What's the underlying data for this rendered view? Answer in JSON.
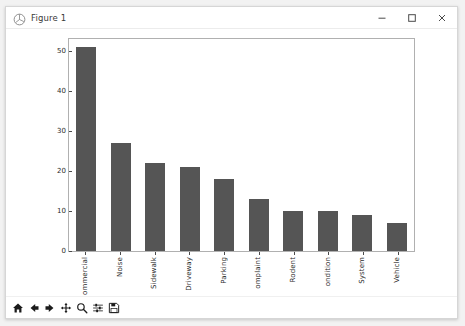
{
  "window": {
    "title": "Figure 1",
    "app_icon": "matplotlib-figure-icon",
    "minimize_label": "–",
    "maximize_label": "□",
    "close_label": "✕"
  },
  "toolbar": {
    "buttons": [
      {
        "name": "home-button",
        "tooltip": "Reset original view"
      },
      {
        "name": "back-button",
        "tooltip": "Back to previous view"
      },
      {
        "name": "forward-button",
        "tooltip": "Forward to next view"
      },
      {
        "name": "pan-button",
        "tooltip": "Pan axes with left mouse, zoom with right"
      },
      {
        "name": "zoom-button",
        "tooltip": "Zoom to rectangle"
      },
      {
        "name": "configure-subplots-button",
        "tooltip": "Configure subplots"
      },
      {
        "name": "save-button",
        "tooltip": "Save the figure"
      }
    ]
  },
  "chart_data": {
    "type": "bar",
    "title": "",
    "xlabel": "",
    "ylabel": "",
    "ylim": [
      0,
      53
    ],
    "yticks": [
      0,
      10,
      20,
      30,
      40,
      50
    ],
    "grid": false,
    "legend": null,
    "bar_color": "#555555",
    "xtick_rotation": 90,
    "categories": [
      "ommercial",
      "Noise",
      "Sidewalk",
      "Driveway",
      "Parking",
      "omplaint",
      "Rodent",
      "ondition",
      "System",
      "Vehicle"
    ],
    "values": [
      51,
      27,
      22,
      21,
      18,
      13,
      10,
      10,
      9,
      7
    ]
  }
}
